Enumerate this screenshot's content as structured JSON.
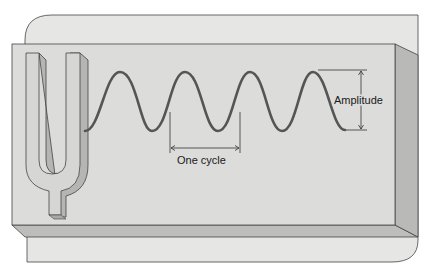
{
  "diagram": {
    "labels": {
      "one_cycle": "One cycle",
      "amplitude": "Amplitude"
    },
    "colors": {
      "background": "#ffffff",
      "back_panel": "#e6e6e4",
      "front_face": "#dcdcda",
      "side_face": "#b9b9b7",
      "bottom_face": "#bdbdbb",
      "wave": "#555555",
      "outline": "#3a3a3a"
    },
    "wave": {
      "cycles": 4,
      "start_x": 85,
      "end_x": 345,
      "peak_y": 72,
      "trough_y": 131
    }
  }
}
